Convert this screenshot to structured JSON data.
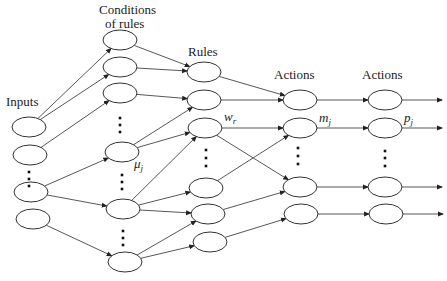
{
  "labels": {
    "inputs": "Inputs",
    "conditions_line1": "Conditions",
    "conditions_line2": "of rules",
    "rules": "Rules",
    "actions1": "Actions",
    "actions2": "Actions"
  },
  "symbols": {
    "mu": "μj",
    "w": "wr",
    "m": "mj",
    "p": "pj"
  },
  "layers": {
    "inputs": [
      [
        29,
        127
      ],
      [
        30,
        155
      ],
      [
        31,
        192
      ],
      [
        33,
        219
      ]
    ],
    "conditions": [
      [
        120,
        40
      ],
      [
        120,
        67
      ],
      [
        120,
        93
      ],
      [
        122,
        152
      ],
      [
        123,
        209
      ],
      [
        125,
        262
      ]
    ],
    "rules": [
      [
        204,
        72
      ],
      [
        204,
        100
      ],
      [
        205,
        128
      ],
      [
        206,
        188
      ],
      [
        208,
        214
      ],
      [
        210,
        242
      ]
    ],
    "actions1": [
      [
        300,
        100
      ],
      [
        300,
        128
      ],
      [
        300,
        187
      ],
      [
        301,
        214
      ]
    ],
    "actions2": [
      [
        385,
        100
      ],
      [
        385,
        128
      ],
      [
        385,
        187
      ],
      [
        386,
        214
      ]
    ]
  },
  "edges": [
    [
      "inputs",
      0,
      "conditions",
      0
    ],
    [
      "inputs",
      0,
      "conditions",
      1
    ],
    [
      "inputs",
      1,
      "conditions",
      2
    ],
    [
      "inputs",
      2,
      "conditions",
      3
    ],
    [
      "inputs",
      2,
      "conditions",
      4
    ],
    [
      "inputs",
      3,
      "conditions",
      5
    ],
    [
      "conditions",
      0,
      "rules",
      0
    ],
    [
      "conditions",
      1,
      "rules",
      0
    ],
    [
      "conditions",
      2,
      "rules",
      1
    ],
    [
      "conditions",
      3,
      "rules",
      1
    ],
    [
      "conditions",
      3,
      "rules",
      2
    ],
    [
      "conditions",
      4,
      "rules",
      2
    ],
    [
      "conditions",
      4,
      "rules",
      3
    ],
    [
      "conditions",
      4,
      "rules",
      4
    ],
    [
      "conditions",
      5,
      "rules",
      4
    ],
    [
      "conditions",
      5,
      "rules",
      5
    ],
    [
      "rules",
      0,
      "actions1",
      0
    ],
    [
      "rules",
      1,
      "actions1",
      0
    ],
    [
      "rules",
      2,
      "actions1",
      1
    ],
    [
      "rules",
      2,
      "actions1",
      2
    ],
    [
      "rules",
      3,
      "actions1",
      1
    ],
    [
      "rules",
      4,
      "actions1",
      2
    ],
    [
      "rules",
      5,
      "actions1",
      3
    ],
    [
      "actions1",
      0,
      "actions2",
      0
    ],
    [
      "actions1",
      1,
      "actions2",
      1
    ],
    [
      "actions1",
      2,
      "actions2",
      2
    ],
    [
      "actions1",
      3,
      "actions2",
      3
    ]
  ],
  "ellipsis_dots": [
    [
      29,
      172
    ],
    [
      29,
      179
    ],
    [
      29,
      186
    ],
    [
      120,
      118
    ],
    [
      120,
      125
    ],
    [
      120,
      132
    ],
    [
      122,
      175
    ],
    [
      122,
      182
    ],
    [
      122,
      189
    ],
    [
      123,
      231
    ],
    [
      123,
      238
    ],
    [
      123,
      245
    ],
    [
      206,
      150
    ],
    [
      206,
      158
    ],
    [
      206,
      166
    ],
    [
      298,
      148
    ],
    [
      298,
      156
    ],
    [
      298,
      164
    ],
    [
      385,
      151
    ],
    [
      385,
      158
    ],
    [
      385,
      166
    ]
  ]
}
